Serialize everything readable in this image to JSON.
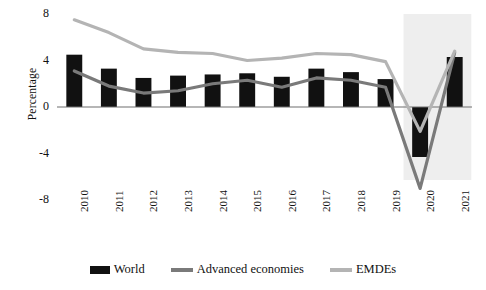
{
  "chart_data": {
    "type": "bar",
    "title": "",
    "subtitle": "",
    "xlabel": "",
    "ylabel": "Percentage",
    "categories": [
      "2010",
      "2011",
      "2012",
      "2013",
      "2014",
      "2015",
      "2016",
      "2017",
      "2018",
      "2019",
      "2020",
      "2021"
    ],
    "ylim": [
      -8,
      8
    ],
    "yticks": [
      8,
      4,
      0,
      -4,
      -8
    ],
    "ytick_labels": [
      "8",
      "4",
      "0",
      "-4",
      "-8"
    ],
    "grid": false,
    "legend_position": "bottom",
    "series": [
      {
        "name": "World",
        "type": "bar",
        "color": "#111111",
        "values": [
          4.5,
          3.3,
          2.5,
          2.7,
          2.8,
          2.9,
          2.6,
          3.3,
          3.0,
          2.4,
          -4.3,
          4.3
        ]
      },
      {
        "name": "Advanced economies",
        "type": "line",
        "color": "#7a7a7a",
        "values": [
          3.1,
          1.8,
          1.2,
          1.4,
          2.0,
          2.3,
          1.7,
          2.5,
          2.3,
          1.7,
          -7.0,
          4.7
        ]
      },
      {
        "name": "EMDEs",
        "type": "line",
        "color": "#b4b4b4",
        "values": [
          7.5,
          6.4,
          5.0,
          4.7,
          4.6,
          4.0,
          4.2,
          4.6,
          4.5,
          3.9,
          -2.1,
          4.8
        ]
      }
    ],
    "shaded_region": {
      "label": "forecast",
      "from_category": "2020",
      "to_category": "2021",
      "color": "#eeeeee"
    },
    "axis_color": "#6f6f6f",
    "zero_line_value": 0
  },
  "legend": {
    "items": [
      {
        "label": "World",
        "marker": "bar-swatch",
        "color": "#111111"
      },
      {
        "label": "Advanced economies",
        "marker": "line-swatch",
        "color": "#7a7a7a"
      },
      {
        "label": "EMDEs",
        "marker": "line-swatch",
        "color": "#b4b4b4"
      }
    ]
  }
}
